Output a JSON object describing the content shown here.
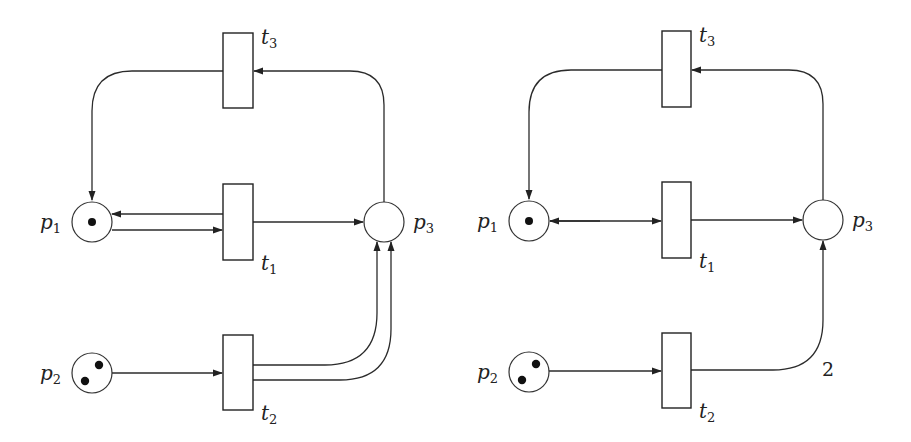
{
  "figure": {
    "left_net": {
      "name": "Petri net with double arcs",
      "places": [
        {
          "id": "p1",
          "label": "p",
          "sub": "1",
          "tokens": 1
        },
        {
          "id": "p2",
          "label": "p",
          "sub": "2",
          "tokens": 2
        },
        {
          "id": "p3",
          "label": "p",
          "sub": "3",
          "tokens": 0
        }
      ],
      "transitions": [
        {
          "id": "t1",
          "label": "t",
          "sub": "1"
        },
        {
          "id": "t2",
          "label": "t",
          "sub": "2"
        },
        {
          "id": "t3",
          "label": "t",
          "sub": "3"
        }
      ],
      "arcs": [
        {
          "from": "p1",
          "to": "t1"
        },
        {
          "from": "t1",
          "to": "p1"
        },
        {
          "from": "t1",
          "to": "p3"
        },
        {
          "from": "p2",
          "to": "t2"
        },
        {
          "from": "t2",
          "to": "p3",
          "count": 2
        },
        {
          "from": "p3",
          "to": "t3"
        },
        {
          "from": "t3",
          "to": "p1"
        }
      ]
    },
    "right_net": {
      "name": "Equivalent Petri net with weighted arcs",
      "places": [
        {
          "id": "p1",
          "label": "p",
          "sub": "1",
          "tokens": 1
        },
        {
          "id": "p2",
          "label": "p",
          "sub": "2",
          "tokens": 2
        },
        {
          "id": "p3",
          "label": "p",
          "sub": "3",
          "tokens": 0
        }
      ],
      "transitions": [
        {
          "id": "t1",
          "label": "t",
          "sub": "1"
        },
        {
          "id": "t2",
          "label": "t",
          "sub": "2"
        },
        {
          "id": "t3",
          "label": "t",
          "sub": "3"
        }
      ],
      "arcs": [
        {
          "from": "p1",
          "to": "t1",
          "bidirectional": true
        },
        {
          "from": "t1",
          "to": "p3"
        },
        {
          "from": "p2",
          "to": "t2"
        },
        {
          "from": "t2",
          "to": "p3",
          "weight": "2"
        },
        {
          "from": "p3",
          "to": "t3"
        },
        {
          "from": "t3",
          "to": "p1"
        }
      ],
      "weight_label": "2"
    }
  }
}
